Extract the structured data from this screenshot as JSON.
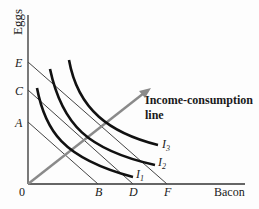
{
  "diagram": {
    "y_axis_label": "Eggs",
    "x_axis_label": "Bacon",
    "origin_label": "0",
    "y_intercepts": [
      "E",
      "C",
      "A"
    ],
    "x_intercepts": [
      "B",
      "D",
      "F"
    ],
    "budget_lines": [
      {
        "from": "A",
        "to": "B"
      },
      {
        "from": "C",
        "to": "D"
      },
      {
        "from": "E",
        "to": "F"
      }
    ],
    "indifference_curves": [
      {
        "label": "I",
        "sub": "1"
      },
      {
        "label": "I",
        "sub": "2"
      },
      {
        "label": "I",
        "sub": "3"
      }
    ],
    "icc_label_line1": "Income-consumption",
    "icc_label_line2": "line",
    "colors": {
      "axis": "#333333",
      "budget_line": "#444444",
      "indifference_curve": "#111111",
      "income_consumption": "#8a8a8a"
    }
  }
}
